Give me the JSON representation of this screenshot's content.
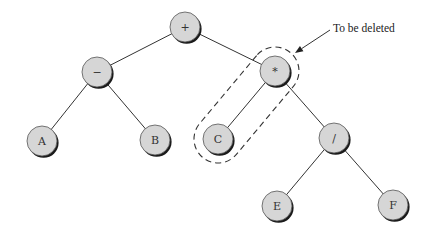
{
  "diagram": {
    "type": "expression-tree",
    "nodes": [
      {
        "id": "plus",
        "label": "+",
        "x": 185,
        "y": 27
      },
      {
        "id": "minus",
        "label": "−",
        "x": 97,
        "y": 72
      },
      {
        "id": "times",
        "label": "*",
        "x": 275,
        "y": 71
      },
      {
        "id": "A",
        "label": "A",
        "x": 42,
        "y": 141
      },
      {
        "id": "B",
        "label": "B",
        "x": 155,
        "y": 140
      },
      {
        "id": "C",
        "label": "C",
        "x": 218,
        "y": 139
      },
      {
        "id": "divide",
        "label": "/",
        "x": 334,
        "y": 138
      },
      {
        "id": "E",
        "label": "E",
        "x": 277,
        "y": 206
      },
      {
        "id": "F",
        "label": "F",
        "x": 393,
        "y": 205
      }
    ],
    "edges": [
      {
        "from": "plus",
        "to": "minus"
      },
      {
        "from": "plus",
        "to": "times"
      },
      {
        "from": "minus",
        "to": "A"
      },
      {
        "from": "minus",
        "to": "B"
      },
      {
        "from": "times",
        "to": "C"
      },
      {
        "from": "times",
        "to": "divide"
      },
      {
        "from": "divide",
        "to": "E"
      },
      {
        "from": "divide",
        "to": "F"
      }
    ],
    "node_radius": 15,
    "colors": {
      "node_fill": "#d6d6d6",
      "node_shadow": "#1a1a1a",
      "edge": "#333333"
    },
    "highlight": {
      "type": "dashed-capsule",
      "encloses": [
        "times",
        "C"
      ],
      "radius": 24
    },
    "annotation": {
      "text": "To be deleted",
      "text_x": 333,
      "text_y": 32,
      "arrow_from": [
        330,
        30
      ],
      "arrow_to": [
        295,
        53
      ]
    }
  }
}
